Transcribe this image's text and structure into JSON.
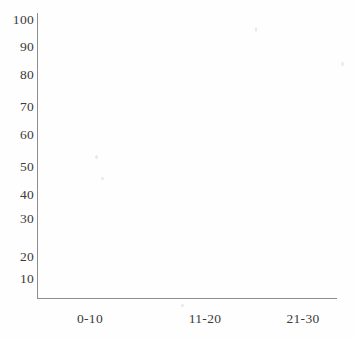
{
  "chart_data": {
    "type": "bar",
    "title": "",
    "subtitle": "",
    "xlabel": "",
    "ylabel": "",
    "categories": [
      "0-10",
      "11-20",
      "21-30"
    ],
    "series": [
      {
        "name": "",
        "values": [
          null,
          null,
          null
        ]
      }
    ],
    "values": [
      null,
      null,
      null
    ],
    "empty": true,
    "note": "Blank axes only - no plotted data in the figure",
    "ylim": [
      0,
      100
    ],
    "y_ticks": [
      10,
      20,
      30,
      40,
      50,
      60,
      70,
      80,
      90,
      100
    ],
    "y_tick_labels": [
      "10",
      "20",
      "30",
      "40",
      "50",
      "60",
      "70",
      "80",
      "90",
      "100"
    ],
    "x_tick_labels": [
      "0-10",
      "11-20",
      "21-30"
    ],
    "grid": false,
    "legend": false,
    "legend_position": "none",
    "axis_color": "#8d8d8d",
    "text_color": "#3a3a3a",
    "background_color": "#fefefe"
  },
  "axes": {
    "y_labels": [
      {
        "text": "100",
        "top": 13
      },
      {
        "text": "90",
        "top": 40
      },
      {
        "text": "80",
        "top": 68
      },
      {
        "text": "70",
        "top": 100
      },
      {
        "text": "60",
        "top": 128
      },
      {
        "text": "50",
        "top": 160
      },
      {
        "text": "40",
        "top": 188
      },
      {
        "text": "30",
        "top": 212
      },
      {
        "text": "20",
        "top": 250
      },
      {
        "text": "10",
        "top": 272
      }
    ],
    "x_labels": [
      {
        "text": "0-10",
        "left": 50
      },
      {
        "text": "11-20",
        "left": 165
      },
      {
        "text": "21-30",
        "left": 263
      }
    ]
  }
}
